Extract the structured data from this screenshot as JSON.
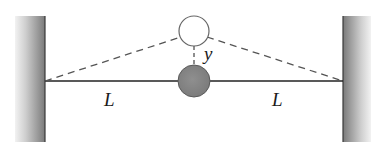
{
  "diagram": {
    "labels": {
      "left_length": "L",
      "right_length": "L",
      "displacement": "y"
    },
    "colors": {
      "wall_dark": "#6e6e6e",
      "wall_light": "#f4f4f4",
      "rope": "#222222",
      "mass_fill": "#858585",
      "mass_outline": "#555555",
      "displaced_outline": "#666666",
      "dashed": "#555555"
    },
    "elements": {
      "left_wall": "wall",
      "right_wall": "wall",
      "rope": "taut string",
      "mass_equilibrium": "filled mass at rest position",
      "mass_displaced": "hollow mass at displaced position"
    }
  }
}
